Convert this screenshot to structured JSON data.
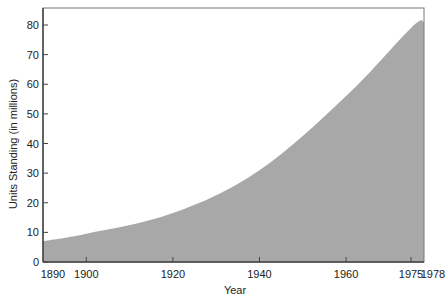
{
  "chart_data": {
    "type": "area",
    "title": "",
    "xlabel": "Year",
    "ylabel": "Units Standing (in millions)",
    "x": [
      1890,
      1900,
      1920,
      1940,
      1960,
      1975,
      1978
    ],
    "series": [
      {
        "name": "Units Standing",
        "values": [
          7,
          9.5,
          16.5,
          31,
          56,
          79,
          81
        ]
      }
    ],
    "xticks": [
      1890,
      1900,
      1920,
      1940,
      1960,
      1975,
      1978
    ],
    "xtick_labels": [
      "1890",
      "1900",
      "1920",
      "1940",
      "1960",
      "1975",
      "1978"
    ],
    "yticks": [
      0,
      10,
      20,
      30,
      40,
      50,
      60,
      70,
      80
    ],
    "ytick_labels": [
      "0",
      "10",
      "20",
      "30",
      "40",
      "50",
      "60",
      "70",
      "80"
    ],
    "xlim": [
      1890,
      1978
    ],
    "ylim": [
      0,
      85
    ],
    "grid": false,
    "legend": null,
    "fill_color": "#a8a8a8",
    "axis_color": "#444444"
  }
}
